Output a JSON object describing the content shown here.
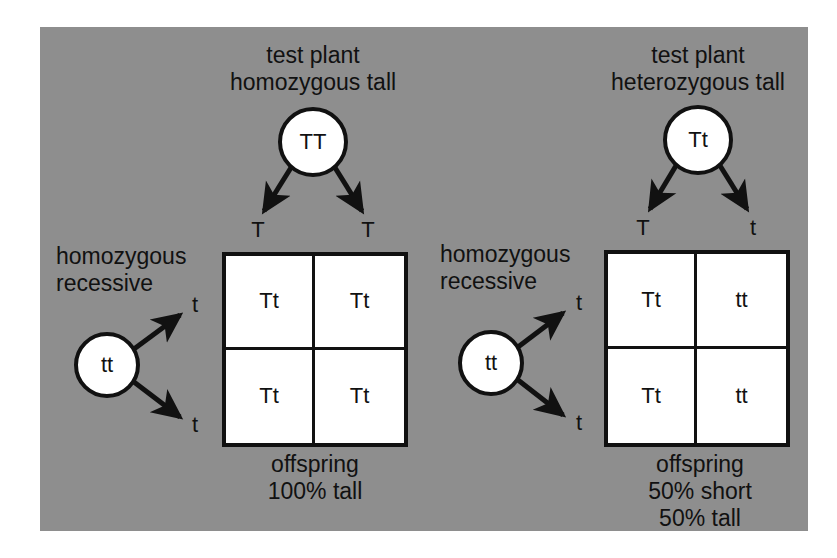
{
  "figure": {
    "panel_color": "#8e8e8e",
    "ink_color": "#111111",
    "box_fill": "#ffffff",
    "page_background": "#ffffff"
  },
  "crosses": [
    {
      "id": "left-cross",
      "parent_top": {
        "caption_line1": "test plant",
        "caption_line2": "homozygous tall",
        "genotype": "TT"
      },
      "parent_side": {
        "caption_line1": "homozygous",
        "caption_line2": "recessive",
        "genotype": "tt"
      },
      "top_gametes": [
        "T",
        "T"
      ],
      "side_gametes": [
        "t",
        "t"
      ],
      "punnett_cells": [
        "Tt",
        "Tt",
        "Tt",
        "Tt"
      ],
      "result_lines": [
        "offspring",
        "100% tall"
      ]
    },
    {
      "id": "right-cross",
      "parent_top": {
        "caption_line1": "test plant",
        "caption_line2": "heterozygous tall",
        "genotype": "Tt"
      },
      "parent_side": {
        "caption_line1": "homozygous",
        "caption_line2": "recessive",
        "genotype": "tt"
      },
      "top_gametes": [
        "T",
        "t"
      ],
      "side_gametes": [
        "t",
        "t"
      ],
      "punnett_cells": [
        "Tt",
        "tt",
        "Tt",
        "tt"
      ],
      "result_lines": [
        "offspring",
        "50% short",
        "50% tall"
      ]
    }
  ]
}
